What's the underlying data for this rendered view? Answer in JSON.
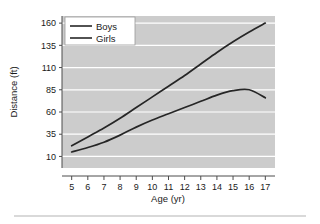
{
  "chart_data": {
    "type": "line",
    "title": "",
    "xlabel": "Age (yr)",
    "ylabel": "Distance (ft)",
    "xlim": [
      4.4,
      17.6
    ],
    "ylim": [
      -3,
      168
    ],
    "xticks": [
      5,
      6,
      7,
      8,
      9,
      10,
      11,
      12,
      13,
      14,
      15,
      16,
      17
    ],
    "yticks": [
      10,
      35,
      60,
      85,
      110,
      135,
      160
    ],
    "grid": "horizontal-white",
    "legend_position": "top-left",
    "plot_background": "#cccccc",
    "line_color": "#262626",
    "x": [
      5,
      6,
      7,
      8,
      9,
      10,
      11,
      12,
      13,
      14,
      15,
      16,
      17
    ],
    "series": [
      {
        "name": "Boys",
        "values": [
          22,
          32,
          42,
          53,
          65,
          77,
          89,
          101,
          114,
          127,
          139,
          150,
          160
        ]
      },
      {
        "name": "Girls",
        "values": [
          15,
          20,
          26,
          34,
          43,
          51,
          58,
          65,
          72,
          79,
          84,
          85,
          76
        ]
      }
    ]
  },
  "axes": {
    "x_title": "Age (yr)",
    "y_title": "Distance (ft)",
    "x_tick_labels": [
      "5",
      "6",
      "7",
      "8",
      "9",
      "10",
      "11",
      "12",
      "13",
      "14",
      "15",
      "16",
      "17"
    ],
    "y_tick_labels": [
      "10",
      "35",
      "60",
      "85",
      "110",
      "135",
      "160"
    ]
  },
  "legend": {
    "entries": [
      {
        "label": "Boys"
      },
      {
        "label": "Girls"
      }
    ]
  }
}
